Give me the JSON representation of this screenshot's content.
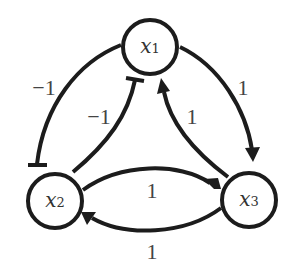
{
  "diagram": {
    "type": "signed-directed-graph",
    "nodes": [
      {
        "id": "x1",
        "var": "x",
        "sub": "1"
      },
      {
        "id": "x2",
        "var": "x",
        "sub": "2"
      },
      {
        "id": "x3",
        "var": "x",
        "sub": "3"
      }
    ],
    "edges": [
      {
        "from": "x1",
        "to": "x2",
        "weight": "−1",
        "kind": "inhibition",
        "route": "outer-left"
      },
      {
        "from": "x2",
        "to": "x1",
        "weight": "−1",
        "kind": "inhibition",
        "route": "inner-left"
      },
      {
        "from": "x1",
        "to": "x3",
        "weight": "1",
        "kind": "activation",
        "route": "outer-right"
      },
      {
        "from": "x3",
        "to": "x1",
        "weight": "1",
        "kind": "activation",
        "route": "inner-right"
      },
      {
        "from": "x2",
        "to": "x3",
        "weight": "1",
        "kind": "activation",
        "route": "upper-bottom"
      },
      {
        "from": "x3",
        "to": "x2",
        "weight": "1",
        "kind": "activation",
        "route": "lower-bottom"
      }
    ]
  }
}
